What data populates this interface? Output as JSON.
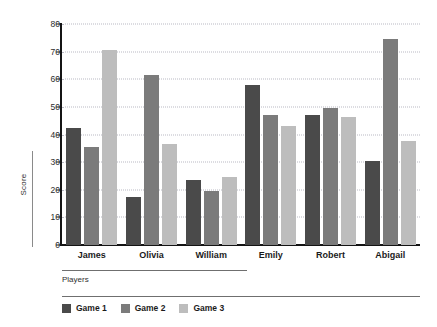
{
  "chart_data": {
    "type": "bar",
    "title": "",
    "xlabel": "Players",
    "ylabel": "Score",
    "categories": [
      "James",
      "Olivia",
      "William",
      "Emily",
      "Robert",
      "Abigail"
    ],
    "series": [
      {
        "name": "Game 1",
        "color": "#4a4a4a",
        "values": [
          42.5,
          17.5,
          23.5,
          58,
          47,
          30.5
        ]
      },
      {
        "name": "Game 2",
        "color": "#7b7b7b",
        "values": [
          35.5,
          61.5,
          19.5,
          47,
          49.5,
          74.5
        ]
      },
      {
        "name": "Game 3",
        "color": "#bdbdbd",
        "values": [
          70.5,
          36.5,
          24.5,
          43,
          46.5,
          37.5
        ]
      }
    ],
    "ylim": [
      0,
      80
    ],
    "ytick_labels": [
      "0",
      "10",
      "20",
      "30",
      "40",
      "50",
      "60",
      "70",
      "80"
    ],
    "ytick_values": [
      0,
      10,
      20,
      30,
      40,
      50,
      60,
      70,
      80
    ],
    "grid": true,
    "grid_axis": "y",
    "grid_style": "dotted",
    "grid_color": "#b9b9c4",
    "legend_position": "bottom-left",
    "axis_color": "#141414",
    "background": "#ffffff"
  }
}
